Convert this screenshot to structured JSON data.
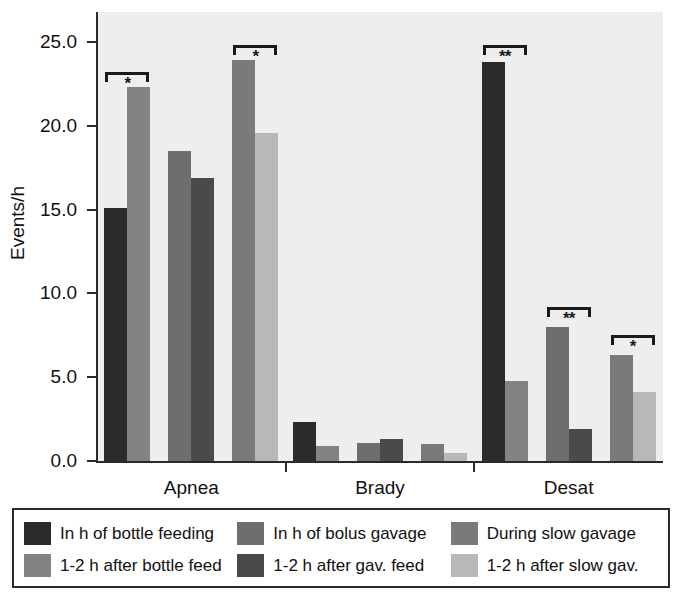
{
  "chart_data": {
    "type": "bar",
    "title": "",
    "xlabel": "",
    "ylabel": "Events/h",
    "ylim": [
      0.0,
      25.0
    ],
    "ytick_labels": [
      "0.0",
      "5.0",
      "10.0",
      "15.0",
      "20.0",
      "25.0"
    ],
    "ytick_values": [
      0.0,
      5.0,
      10.0,
      15.0,
      20.0,
      25.0
    ],
    "grid": false,
    "legend_position": "bottom",
    "categories": [
      "Apnea",
      "Brady",
      "Desat"
    ],
    "series": [
      {
        "name": "In h of bottle feeding",
        "color": "#2b2b2b",
        "values": [
          15.1,
          2.3,
          23.8
        ]
      },
      {
        "name": "1-2 h after bottle feed",
        "color": "#838383",
        "values": [
          22.3,
          0.9,
          4.8
        ]
      },
      {
        "name": "In h of bolus gavage",
        "color": "#6e6e6e",
        "values": [
          18.5,
          1.1,
          8.0
        ]
      },
      {
        "name": "1-2 h after gav. feed",
        "color": "#4a4a4a",
        "values": [
          16.9,
          1.3,
          1.9
        ]
      },
      {
        "name": "During slow gavage",
        "color": "#7a7a7a",
        "values": [
          23.9,
          1.0,
          6.3
        ]
      },
      {
        "name": "1-2 h after slow gav.",
        "color": "#b8b8b8",
        "values": [
          19.6,
          0.5,
          4.1
        ]
      }
    ],
    "annotations": [
      {
        "group": "Apnea",
        "between": [
          "In h of bottle feeding",
          "1-2 h after bottle feed"
        ],
        "stars": "*",
        "y": 23.2
      },
      {
        "group": "Apnea",
        "between": [
          "During slow gavage",
          "1-2 h after slow gav."
        ],
        "stars": "*",
        "y": 24.8
      },
      {
        "group": "Desat",
        "between": [
          "In h of bottle feeding",
          "1-2 h after bottle feed"
        ],
        "stars": "**",
        "y": 24.8
      },
      {
        "group": "Desat",
        "between": [
          "In h of bolus gavage",
          "1-2 h after gav. feed"
        ],
        "stars": "**",
        "y": 9.2
      },
      {
        "group": "Desat",
        "between": [
          "During slow gavage",
          "1-2 h after slow gav."
        ],
        "stars": "*",
        "y": 7.5
      }
    ]
  },
  "legend": {
    "entries": [
      {
        "label": "In h of bottle feeding",
        "color": "#2b2b2b"
      },
      {
        "label": "In h of bolus gavage",
        "color": "#6e6e6e"
      },
      {
        "label": "During slow gavage",
        "color": "#7a7a7a"
      },
      {
        "label": "1-2 h after bottle feed",
        "color": "#838383"
      },
      {
        "label": "1-2 h after gav. feed",
        "color": "#4a4a4a"
      },
      {
        "label": "1-2 h after slow gav.",
        "color": "#b8b8b8"
      }
    ]
  },
  "colors": {
    "plot_background": "#eeeeee",
    "figure_background": "#ffffff",
    "axis": "#2a2a2a",
    "text": "#111111"
  }
}
